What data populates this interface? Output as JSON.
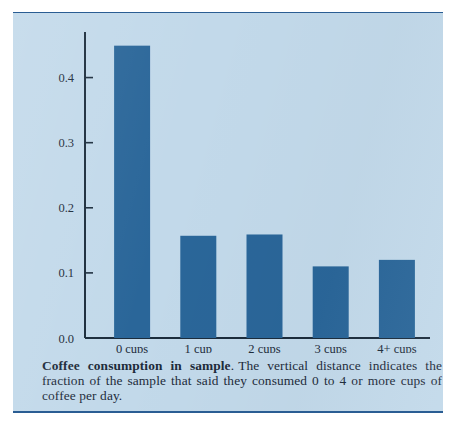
{
  "figure": {
    "background_color": "#c2d9ea",
    "rule_color": "#2a5d93",
    "caption": {
      "title": "Coffee consumption in sample",
      "title_suffix": ".",
      "body": "The vertical distance indicates the fraction of the sample that said they consumed 0 to 4 or more cups of coffee per day."
    }
  },
  "chart_data": {
    "type": "bar",
    "title": "",
    "xlabel": "",
    "ylabel": "",
    "categories": [
      "0 cups",
      "1 cup",
      "2 cups",
      "3 cups",
      "4+ cups"
    ],
    "values": [
      0.449,
      0.157,
      0.159,
      0.11,
      0.12
    ],
    "ylim": [
      0.0,
      0.47
    ],
    "yticks": [
      0.0,
      0.1,
      0.2,
      0.3,
      0.4
    ],
    "ytick_labels": [
      "0.0",
      "0.1",
      "0.2",
      "0.3",
      "0.4"
    ],
    "grid": false,
    "legend": null,
    "bar_color": "#2a6699",
    "axis_color": "#1b2c3c"
  }
}
